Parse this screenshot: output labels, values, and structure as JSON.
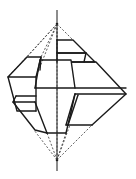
{
  "diagram": {
    "title": "",
    "colors": {
      "line": "#1a1a1a",
      "background": "#ffffff"
    },
    "vanishing_points": {
      "top": [
        57,
        24
      ],
      "bottom": [
        57,
        160
      ]
    },
    "axis": {
      "x": 57,
      "y_start": 10,
      "y_end": 171
    }
  }
}
